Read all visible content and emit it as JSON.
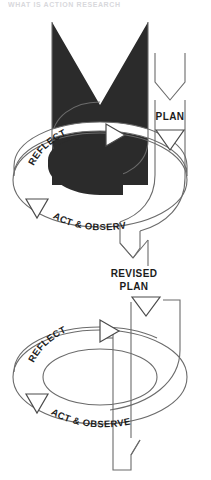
{
  "figure": {
    "title_partial": "WHAT IS ACTION RESEARCH",
    "type": "action-research-spiral-diagram",
    "background_color": "#ffffff",
    "ink_color": "#2b2b2b",
    "outline_color": "#6b6b6b"
  },
  "cycles": [
    {
      "id": "cycle-1",
      "style": "filled-black",
      "entry_label": "PLAN",
      "entry_marker": "down-triangle",
      "steps": [
        {
          "label": "REFLECT",
          "marker": "right-triangle"
        },
        {
          "label": "ACT & OBSERVE",
          "marker": "left-triangle"
        }
      ]
    },
    {
      "id": "cycle-2",
      "style": "outline-white",
      "entry_label_line_1": "REVISED",
      "entry_label_line_2": "PLAN",
      "entry_marker": "down-triangle",
      "steps": [
        {
          "label": "REFLECT",
          "marker": "right-triangle"
        },
        {
          "label": "ACT & OBSERVE",
          "marker": "left-triangle"
        }
      ]
    }
  ],
  "connector": {
    "label": "ribbon-tail",
    "from": "cycle-1",
    "to": "cycle-2"
  }
}
